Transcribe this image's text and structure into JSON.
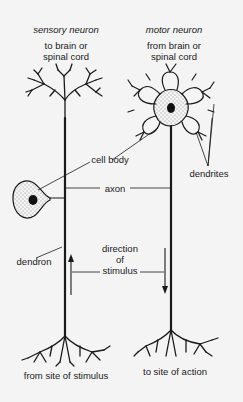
{
  "diagram": {
    "sensory": {
      "title": "sensory neuron",
      "top_line1": "to brain or",
      "top_line2": "spinal cord",
      "bottom": "from site of stimulus"
    },
    "motor": {
      "title": "motor neuron",
      "top_line1": "from brain or",
      "top_line2": "spinal cord",
      "bottom": "to site of action"
    },
    "labels": {
      "cell_body": "cell body",
      "axon": "axon",
      "dendrites": "dendrites",
      "dendron": "dendron",
      "direction_line1": "direction",
      "direction_line2": "of",
      "direction_line3": "stimulus"
    },
    "colors": {
      "background": "#f4f4f4",
      "ink": "#1a1a1a"
    }
  }
}
